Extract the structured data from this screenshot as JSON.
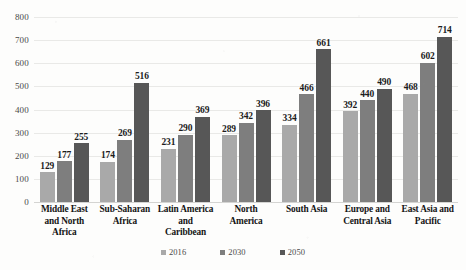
{
  "chart_data": {
    "type": "bar",
    "title": "",
    "subtitle": "",
    "xlabel": "",
    "ylabel": "",
    "ylim": [
      0,
      800
    ],
    "ytick_step": 100,
    "yticks": [
      "800",
      "700",
      "600",
      "500",
      "400",
      "300",
      "200",
      "100",
      "0"
    ],
    "grid": true,
    "legend_position": "bottom",
    "categories": [
      "Middle East and North Africa",
      "Sub-Saharan Africa",
      "Latin America and Caribbean",
      "North America",
      "South Asia",
      "Europe and Central Asia",
      "East Asia and Pacific"
    ],
    "category_lines": [
      [
        "Middle East",
        "and North",
        "Africa"
      ],
      [
        "Sub-Saharan",
        "Africa"
      ],
      [
        "Latin America",
        "and",
        "Caribbean"
      ],
      [
        "North",
        "America"
      ],
      [
        "South Asia"
      ],
      [
        "Europe and",
        "Central Asia"
      ],
      [
        "East Asia and",
        "Pacific"
      ]
    ],
    "series": [
      {
        "name": "2016",
        "color": "#a9a9a9",
        "values": [
          129,
          174,
          231,
          289,
          334,
          392,
          468
        ]
      },
      {
        "name": "2030",
        "color": "#7e7e7e",
        "values": [
          177,
          269,
          290,
          342,
          466,
          440,
          602
        ]
      },
      {
        "name": "2050",
        "color": "#575757",
        "values": [
          255,
          516,
          369,
          396,
          661,
          490,
          714
        ]
      }
    ]
  },
  "legend": {
    "items": [
      {
        "label": "2016",
        "color": "#a9a9a9"
      },
      {
        "label": "2030",
        "color": "#7e7e7e"
      },
      {
        "label": "2050",
        "color": "#575757"
      }
    ]
  }
}
